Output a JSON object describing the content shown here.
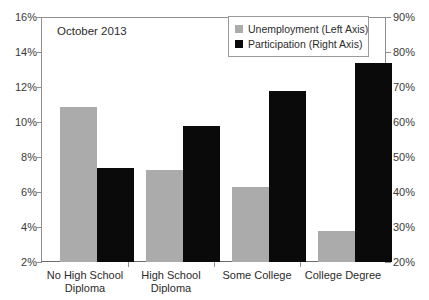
{
  "chart_data": {
    "type": "bar",
    "title": "",
    "annotation": "October 2013",
    "categories": [
      "No High School Diploma",
      "High School Diploma",
      "Some College",
      "College Degree"
    ],
    "category_lines": [
      [
        "No High School",
        "Diploma"
      ],
      [
        "High School",
        "Diploma"
      ],
      [
        "Some College",
        ""
      ],
      [
        "College Degree",
        ""
      ]
    ],
    "series": [
      {
        "name": "Unemployment (Left Axis)",
        "axis": "left",
        "color": "#ababab",
        "values": [
          10.9,
          7.3,
          6.3,
          3.8
        ]
      },
      {
        "name": "Participation (Right Axis)",
        "axis": "right",
        "color": "#0a0a0a",
        "values": [
          47,
          59,
          69,
          77
        ]
      }
    ],
    "xlabel": "",
    "ylabel": "",
    "ylim": [
      2,
      16
    ],
    "y2lim": [
      20,
      90
    ],
    "yticks": [
      2,
      4,
      6,
      8,
      10,
      12,
      14,
      16
    ],
    "ytick_labels": [
      "2%",
      "4%",
      "6%",
      "8%",
      "10%",
      "12%",
      "14%",
      "16%"
    ],
    "y2ticks": [
      20,
      30,
      40,
      50,
      60,
      70,
      80,
      90
    ],
    "y2tick_labels": [
      "20%",
      "30%",
      "40%",
      "50%",
      "60%",
      "70%",
      "80%",
      "90%"
    ],
    "grid": false,
    "legend_position": "top-right"
  },
  "legend": {
    "items": [
      {
        "label": "Unemployment (Left Axis)",
        "color": "#ababab"
      },
      {
        "label": "Participation (Right Axis)",
        "color": "#0a0a0a"
      }
    ]
  }
}
